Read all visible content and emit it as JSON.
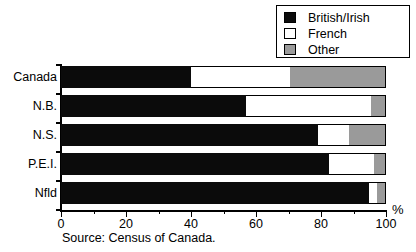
{
  "chart_data": {
    "type": "bar",
    "orientation": "horizontal",
    "stacked": true,
    "title": "",
    "xlabel": "%",
    "ylabel": "",
    "xlim": [
      0,
      100
    ],
    "xticks": [
      0,
      20,
      40,
      60,
      80,
      100
    ],
    "xticklabels": [
      "0",
      "20",
      "40",
      "60",
      "80",
      "100"
    ],
    "minor_tick_interval": 10,
    "grid": false,
    "legend_position": "top-right",
    "categories": [
      "Canada",
      "N.B.",
      "N.S.",
      "P.E.I.",
      "Nfld"
    ],
    "series": [
      {
        "name": "British/Irish",
        "color": "#0b0b0b",
        "values": [
          40.0,
          56.8,
          79.0,
          82.4,
          94.8
        ]
      },
      {
        "name": "French",
        "color": "#ffffff",
        "values": [
          30.4,
          38.6,
          9.6,
          13.9,
          2.3
        ]
      },
      {
        "name": "Other",
        "color": "#9a9a9a",
        "values": [
          29.6,
          4.6,
          11.4,
          3.7,
          2.9
        ]
      }
    ],
    "annotation": "Source: Census of Canada."
  },
  "legend": {
    "items": [
      {
        "label": "British/Irish",
        "swatch": "black-swatch",
        "color": "#0b0b0b"
      },
      {
        "label": "French",
        "swatch": "white-swatch",
        "color": "#ffffff"
      },
      {
        "label": "Other",
        "swatch": "grey-swatch",
        "color": "#9a9a9a"
      }
    ]
  },
  "axis": {
    "unit_label": "%",
    "tick_labels": [
      "0",
      "20",
      "40",
      "60",
      "80",
      "100"
    ]
  },
  "footer": {
    "source": "Source: Census of Canada."
  }
}
